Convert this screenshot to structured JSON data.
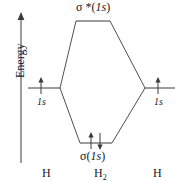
{
  "diagram": {
    "kind": "molecular-orbital-energy-level-diagram",
    "axis": {
      "label": "Energy",
      "direction": "up"
    },
    "levels": {
      "antibonding": {
        "label_sigma": "σ *(",
        "label_orbital": "1s",
        "label_close": ")",
        "electrons": 0,
        "electron_glyphs": ""
      },
      "bonding": {
        "label_sigma": "σ(",
        "label_orbital": "1s",
        "label_close": ")",
        "electrons": 2,
        "electron_glyphs": "↑↓"
      },
      "atomic_left": {
        "label_orbital": "1s",
        "electrons": 1,
        "electron_glyphs": "↑"
      },
      "atomic_right": {
        "label_orbital": "1s",
        "electrons": 1,
        "electron_glyphs": "↑"
      }
    },
    "species": {
      "left": "H",
      "center_symbol": "H",
      "center_subscript": "2",
      "right": "H"
    },
    "colors": {
      "line": "#3a3a3a",
      "text": "#1a1a1a",
      "background": "#ffffff"
    }
  }
}
